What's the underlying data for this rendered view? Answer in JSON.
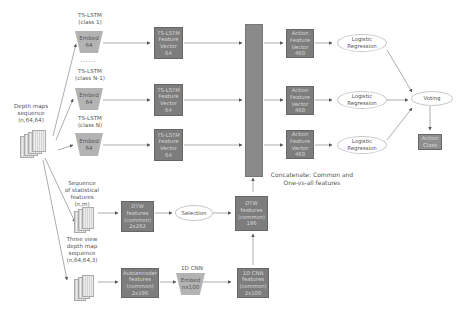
{
  "input": {
    "depth_maps_label": "Depth maps\nsequence\n(n,64,64)",
    "statistical_label": "Sequence\nof statistical\nfeatures\n(n,m)",
    "three_view_label": "Three view\ndepth map\nsequence\n(n,64,64,3)"
  },
  "ts_lstm_branches": [
    {
      "title": "TS-LSTM\n(class 1)",
      "embed": "Embed\n64",
      "feature": "TS-LSTM\nFeature\nVector\n64",
      "action": "Action\nFeature\nVector\n460",
      "classifier": "Logistic\nRegression"
    },
    {
      "title": "TS-LSTM\n(class N-1)",
      "embed": "Embed\n64",
      "feature": "TS-LSTM\nFeature\nVector\n64",
      "action": "Action\nFeature\nVector\n460",
      "classifier": "Logistic\nRegression"
    },
    {
      "title": "TS-LSTM\n(class N)",
      "embed": "Embed\n64",
      "feature": "TS-LSTM\nFeature\nVector\n64",
      "action": "Action\nFeature\nVector\n460",
      "classifier": "Logistic\nRegression"
    }
  ],
  "ellipsis": "......",
  "dtw_branch": {
    "dtw_features": "DTW\nfeatures\n(common)\n2x292",
    "selection": "Selection",
    "dtw_selected": "DTW\nfeatures\n(common)\n196"
  },
  "cnn_branch": {
    "autoencoder": "Autoencoder\nfeatures\n(common)\n2x196",
    "cnn_title": "1D CNN",
    "embed": "Embed\nnx100",
    "cnn_features": "1D CNN\nfeatures\n(common)\n2x100"
  },
  "concat_label": "Concatenate: Common and\nOne-vs-all features",
  "voting": "Voting",
  "output": "Action\nClass",
  "colors": {
    "box": "#7d7d7d",
    "trapezoid": "#b3b3b3",
    "concat": "#8a8a8a",
    "ellipse_border": "#c8c8c8",
    "line": "#888888"
  }
}
